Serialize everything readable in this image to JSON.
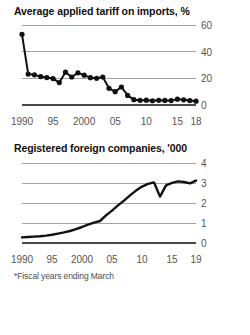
{
  "figure": {
    "footnote": "*Fiscal years ending March",
    "colors": {
      "line": "#111111",
      "gridline": "#9a9a9a",
      "axis": "#4a4a4a",
      "label": "#555555",
      "title": "#111111",
      "background": "#ffffff"
    }
  },
  "charts": [
    {
      "id": "tariff",
      "title": "Average applied tariff on imports, %",
      "chart_data": {
        "type": "line",
        "title": "Average applied tariff on imports, %",
        "xlabel": "",
        "ylabel": "%",
        "markers": true,
        "grid": true,
        "legend": null,
        "xlim": [
          1990,
          2018
        ],
        "ylim": [
          0,
          60
        ],
        "yticks": [
          0,
          20,
          40,
          60
        ],
        "ytick_labels": [
          "0",
          "20",
          "40",
          "60"
        ],
        "xticks": [
          1990,
          1995,
          2000,
          2005,
          2010,
          2015,
          2018
        ],
        "xtick_labels": [
          "1990",
          "95",
          "2000",
          "05",
          "10",
          "15",
          "18"
        ],
        "x": [
          1990,
          1991,
          1992,
          1993,
          1994,
          1995,
          1996,
          1997,
          1998,
          1999,
          2000,
          2001,
          2002,
          2003,
          2004,
          2005,
          2006,
          2007,
          2008,
          2009,
          2010,
          2011,
          2012,
          2013,
          2014,
          2015,
          2016,
          2017,
          2018
        ],
        "values": [
          53.0,
          23.2,
          22.6,
          21.3,
          20.6,
          19.8,
          16.8,
          24.6,
          21.0,
          24.1,
          22.4,
          20.5,
          20.0,
          21.0,
          12.5,
          10.0,
          13.5,
          7.2,
          4.0,
          3.5,
          3.6,
          3.2,
          3.5,
          3.4,
          3.3,
          4.4,
          3.9,
          3.3,
          2.9
        ]
      }
    },
    {
      "id": "companies",
      "title": "Registered foreign companies, '000",
      "chart_data": {
        "type": "line",
        "title": "Registered foreign companies, '000",
        "xlabel": "",
        "ylabel": "'000",
        "markers": false,
        "grid": true,
        "legend": null,
        "xlim": [
          1990,
          2019
        ],
        "ylim": [
          0,
          4
        ],
        "yticks": [
          0,
          1,
          2,
          3,
          4
        ],
        "ytick_labels": [
          "0",
          "1",
          "2",
          "3",
          "4"
        ],
        "xticks": [
          1990,
          1995,
          2000,
          2005,
          2010,
          2015,
          2019
        ],
        "xtick_labels": [
          "1990",
          "95",
          "2000",
          "05",
          "10",
          "15",
          "19"
        ],
        "x": [
          1990,
          1991,
          1992,
          1993,
          1994,
          1995,
          1996,
          1997,
          1998,
          1999,
          2000,
          2001,
          2002,
          2003,
          2004,
          2005,
          2006,
          2007,
          2008,
          2009,
          2010,
          2011,
          2012,
          2013,
          2014,
          2015,
          2016,
          2017,
          2018,
          2019
        ],
        "values": [
          0.28,
          0.3,
          0.32,
          0.34,
          0.37,
          0.41,
          0.47,
          0.53,
          0.6,
          0.69,
          0.8,
          0.92,
          1.02,
          1.1,
          1.38,
          1.62,
          1.88,
          2.12,
          2.38,
          2.62,
          2.82,
          2.96,
          3.03,
          2.32,
          2.88,
          3.01,
          3.08,
          3.05,
          2.98,
          3.12
        ]
      }
    }
  ]
}
